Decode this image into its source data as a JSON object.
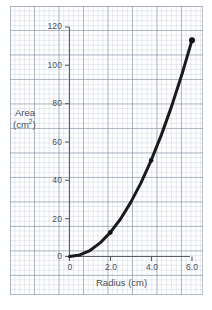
{
  "chart_data": {
    "type": "line",
    "title": "",
    "xlabel": "Radius (cm)",
    "ylabel": "Area (cm²)",
    "ylabel_main": "Area",
    "ylabel_unit_prefix": "(cm",
    "ylabel_unit_sup": "2",
    "ylabel_unit_suffix": ")",
    "xlim": [
      0,
      6.6
    ],
    "ylim": [
      0,
      124
    ],
    "grid": true,
    "grid_style": "graph-paper",
    "legend": "none",
    "xticks": [
      0,
      2.0,
      4.0,
      6.0
    ],
    "xtick_labels": [
      "0",
      "2.0",
      "4.0",
      "6.0"
    ],
    "yticks": [
      0,
      20,
      40,
      60,
      80,
      100,
      120
    ],
    "ytick_labels": [
      "0",
      "20",
      "40",
      "60",
      "80",
      "100",
      "120"
    ],
    "series": [
      {
        "name": "Area of circle",
        "relation": "A = pi * r^2",
        "x": [
          0,
          0.5,
          1.0,
          1.5,
          2.0,
          2.5,
          3.0,
          3.5,
          4.0,
          4.5,
          5.0,
          5.5,
          6.0
        ],
        "y": [
          0,
          0.8,
          3.1,
          7.1,
          12.6,
          19.6,
          28.3,
          38.5,
          50.3,
          63.6,
          78.5,
          95.0,
          113.1
        ]
      }
    ],
    "markers": [
      {
        "x": 2.0,
        "y": 12.6
      },
      {
        "x": 4.0,
        "y": 50.3
      },
      {
        "x": 6.0,
        "y": 113.1
      }
    ],
    "colors": {
      "curve": "#1a1a1a",
      "axis": "#5a5f6b",
      "grid_major": "#788296",
      "grid_minor": "#96a0b4",
      "text": "#4c515c",
      "background": "#ffffff"
    }
  }
}
